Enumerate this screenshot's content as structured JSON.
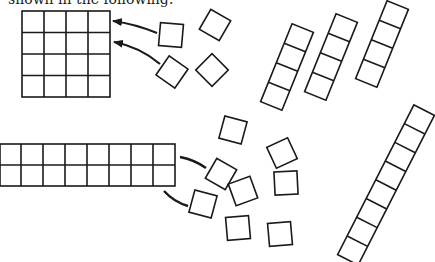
{
  "caption": "shown in the following:",
  "colors": {
    "stroke": "#1a1a1a",
    "background": "#ffffff"
  },
  "figure": {
    "square_grid": {
      "rows": 4,
      "cols": 4,
      "x": 22,
      "y": 11,
      "cell": 22
    },
    "rect_grid": {
      "rows": 2,
      "cols": 8,
      "x": 0,
      "y": 144,
      "cell": 22
    },
    "arrows": [
      {
        "label": "arrow-to-square-grid-1"
      },
      {
        "label": "arrow-to-square-grid-2"
      }
    ],
    "loose_tiles_count": 15,
    "strips": [
      {
        "cells": 4
      },
      {
        "cells": 4
      },
      {
        "cells": 4
      },
      {
        "cells": 8
      }
    ]
  }
}
